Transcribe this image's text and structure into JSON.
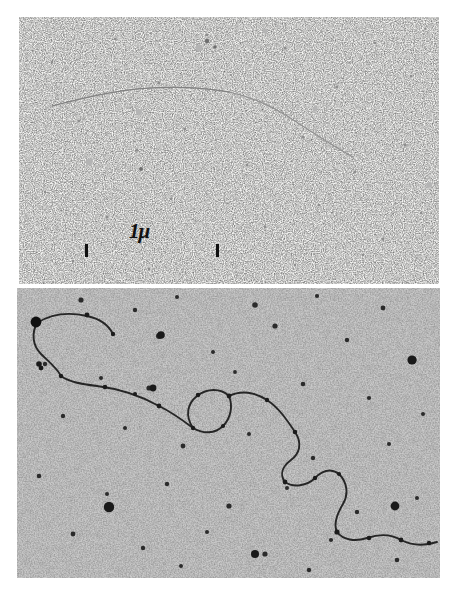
{
  "figure": {
    "type": "electron-micrograph-plate",
    "background_color": "#ffffff",
    "panels": [
      {
        "id": "top",
        "label": "upper micrograph",
        "background_color": "#f7f7f5",
        "contrast": "light-field, fine dark speckle",
        "specimen": "single extended DNA filament, smooth shallow arc descending left-to-right",
        "scalebar": {
          "label": "1μ",
          "length_px": 134,
          "color": "#111111"
        }
      },
      {
        "id": "bottom",
        "label": "lower micrograph",
        "background_color": "#c9c9c9",
        "contrast": "grey-field, coarse dark grain with large dark dots",
        "specimen": "single long kinked DNA molecule with a small internal loop and a dense end blob",
        "scalebar": {
          "label": "1μ",
          "length_px": 127,
          "color": "#111111"
        }
      }
    ],
    "scalebar_label": "1μ",
    "colors": {
      "ink": "#111111",
      "page": "#ffffff",
      "top_field": "#f7f7f5",
      "bottom_field": "#c9c9c9"
    }
  }
}
